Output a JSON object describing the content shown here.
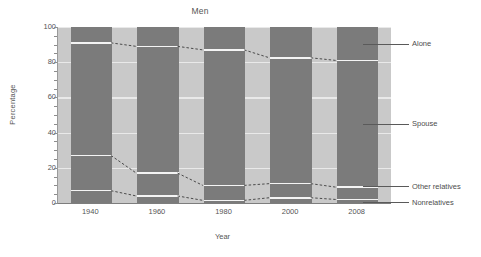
{
  "chart_data": {
    "type": "bar",
    "subtype": "stacked-percentage",
    "title": "Men",
    "xlabel": "Year",
    "ylabel": "Percentage",
    "categories": [
      "1940",
      "1960",
      "1980",
      "2000",
      "2008"
    ],
    "ylim": [
      0,
      100
    ],
    "yticks": [
      0,
      20,
      40,
      60,
      80,
      100
    ],
    "ytick_labels": [
      "0",
      "20",
      "40",
      "60",
      "80",
      "100"
    ],
    "grid": true,
    "legend_position": "right-callout",
    "series": [
      {
        "name": "Nonrelatives",
        "values": [
          7.0,
          4.0,
          1.5,
          3.0,
          2.0
        ]
      },
      {
        "name": "Other relatives",
        "values": [
          20.0,
          13.0,
          8.5,
          8.0,
          7.0
        ]
      },
      {
        "name": "Spouse",
        "values": [
          64.0,
          72.0,
          77.0,
          71.5,
          72.0
        ]
      },
      {
        "name": "Alone",
        "values": [
          9.0,
          11.0,
          13.0,
          17.5,
          19.0
        ]
      }
    ],
    "cumulative_tops": {
      "nonrelatives": [
        7.0,
        4.0,
        1.5,
        3.0,
        2.0
      ],
      "other_relatives": [
        27.0,
        17.0,
        10.0,
        11.0,
        9.0
      ],
      "spouse": [
        91.0,
        89.0,
        87.0,
        82.5,
        81.0
      ],
      "alone": [
        100,
        100,
        100,
        100,
        100
      ]
    },
    "colors": {
      "segment_dark": "#7b7b7b",
      "plot_background": "#c9c9c9",
      "separator": "#f4f4f4",
      "gridline": "#efefef",
      "axis": "#7d7d7d",
      "text": "#555555",
      "connector": "#3c3c3c"
    }
  },
  "legend": {
    "items": [
      {
        "label": "Alone"
      },
      {
        "label": "Spouse"
      },
      {
        "label": "Other relatives"
      },
      {
        "label": "Nonrelatives"
      }
    ]
  }
}
